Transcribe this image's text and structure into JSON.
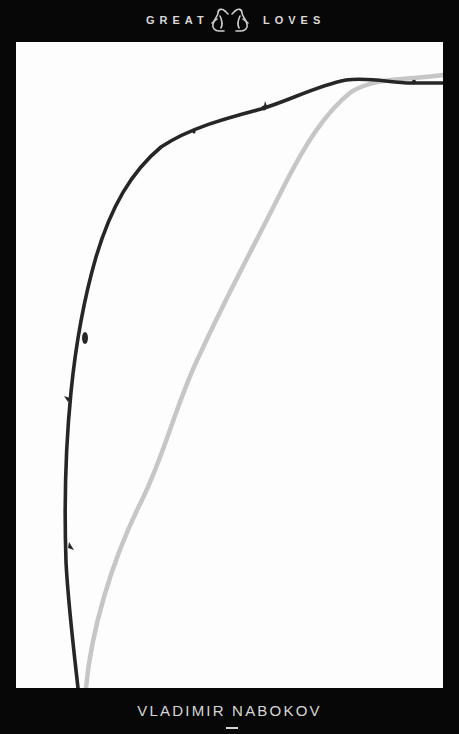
{
  "cover": {
    "series": {
      "left_word": "GREAT",
      "right_word": "LOVES",
      "logo_icon": "penguin-pair-icon"
    },
    "author": {
      "name": "VLADIMIR NABOKOV"
    },
    "artwork": {
      "description": "Two thin branches curving up from the bottom-left and arching to the top-right on a white background",
      "branches": [
        {
          "name": "dark-branch",
          "color": "#2a2a2a"
        },
        {
          "name": "light-branch",
          "color": "#c4c4c4"
        }
      ]
    },
    "colors": {
      "frame": "#070707",
      "panel": "#fdfdfd",
      "text": "#d8d8d8"
    }
  }
}
